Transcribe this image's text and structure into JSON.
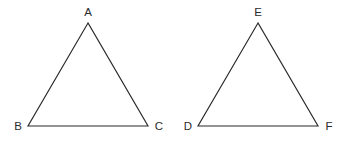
{
  "canvas": {
    "width": 347,
    "height": 142,
    "background_color": "#ffffff",
    "stroke_color": "#2b2b2b",
    "label_color": "#2b2b2b"
  },
  "figures": [
    {
      "name": "triangle-abc",
      "points": "88,23 28,126 148,126",
      "vertices": [
        {
          "label": "A",
          "x": 88,
          "y": 23,
          "label_x": 88,
          "label_y": 16,
          "anchor": "middle"
        },
        {
          "label": "B",
          "x": 28,
          "y": 126,
          "label_x": 18,
          "label_y": 130,
          "anchor": "middle"
        },
        {
          "label": "C",
          "x": 148,
          "y": 126,
          "label_x": 159,
          "label_y": 130,
          "anchor": "middle"
        }
      ]
    },
    {
      "name": "triangle-def",
      "points": "258,23 198,126, 318,126",
      "vertices": [
        {
          "label": "E",
          "x": 258,
          "y": 23,
          "label_x": 258,
          "label_y": 16,
          "anchor": "middle"
        },
        {
          "label": "D",
          "x": 198,
          "y": 126,
          "label_x": 188,
          "label_y": 130,
          "anchor": "middle"
        },
        {
          "label": "F",
          "x": 318,
          "y": 126,
          "label_x": 329,
          "label_y": 130,
          "anchor": "middle"
        }
      ]
    }
  ]
}
